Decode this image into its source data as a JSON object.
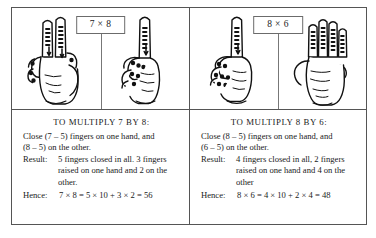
{
  "figure": {
    "border_color": "#555555",
    "text_color": "#1a1a1a",
    "background": "#ffffff"
  },
  "panels": [
    {
      "id": "panel-7x8",
      "label": "7 × 8",
      "hands": [
        {
          "name": "left-hand-two-raised",
          "raised_fingers": 2,
          "closed_fingers": 3,
          "orientation": "left"
        },
        {
          "name": "right-hand-one-raised",
          "raised_fingers": 1,
          "closed_fingers": 4,
          "orientation": "right"
        }
      ],
      "caption": {
        "title": "TO MULTIPLY 7 BY 8:",
        "line1": "Close (7 – 5) fingers on one hand, and",
        "line2": "(8 – 5) on the other.",
        "result_key": "Result:",
        "result_line1": "5 fingers closed in all. 3 fingers",
        "result_line2": "raised on one hand and 2 on the",
        "result_line3": "other.",
        "hence_key": "Hence:",
        "hence_value": "7 × 8 = 5 × 10 + 3 × 2 = 56"
      }
    },
    {
      "id": "panel-8x6",
      "label": "8 × 6",
      "hands": [
        {
          "name": "left-hand-one-raised",
          "raised_fingers": 1,
          "closed_fingers": 4,
          "orientation": "left"
        },
        {
          "name": "right-hand-four-raised",
          "raised_fingers": 4,
          "closed_fingers": 1,
          "orientation": "right"
        }
      ],
      "caption": {
        "title": "TO MULTIPLY 8 BY 6:",
        "line1": "Close (8 – 5) fingers on one hand, and",
        "line2": "(6 – 5) on the other.",
        "result_key": "Result:",
        "result_line1": "4 fingers closed in all, 2 fingers",
        "result_line2": "raised on one hand and 4 on the",
        "result_line3": "other",
        "hence_key": "Hence:",
        "hence_value": "8 × 6 = 4 × 10 + 2 × 4 = 48"
      }
    }
  ]
}
